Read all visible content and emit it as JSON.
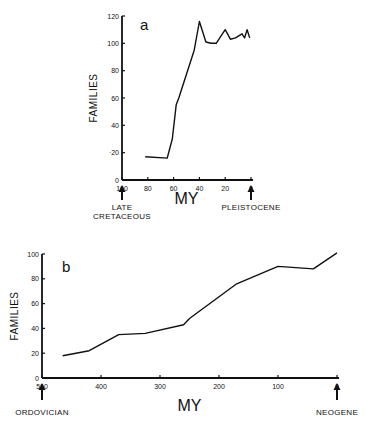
{
  "chart_data": [
    {
      "type": "line",
      "panel_label": "a",
      "title": "",
      "xlabel": "MY",
      "ylabel": "FAMILIES",
      "x_reversed": true,
      "xlim": [
        100,
        0
      ],
      "ylim": [
        0,
        120
      ],
      "x_ticks": [
        100,
        80,
        60,
        40,
        20,
        0
      ],
      "y_ticks": [
        0,
        20,
        40,
        60,
        80,
        100,
        120
      ],
      "y_tick_labels": [
        "0",
        "·20",
        "40",
        "60",
        "80",
        "100",
        "120"
      ],
      "grid": false,
      "annotations": [
        {
          "x": 100,
          "text": "LATE CRETACEOUS",
          "lines": [
            "LATE",
            "CRETACEOUS"
          ],
          "arrow": "up"
        },
        {
          "x": 0,
          "text": "PLEISTOCENE",
          "lines": [
            "PLEISTOCENE"
          ],
          "arrow": "up"
        }
      ],
      "series": [
        {
          "name": "families",
          "x": [
            82,
            65,
            61,
            58,
            56,
            44,
            40,
            35,
            31,
            27,
            20,
            16,
            12,
            7,
            5,
            3,
            1
          ],
          "y": [
            17,
            16,
            30,
            55,
            60,
            95,
            116,
            101,
            100,
            100,
            110,
            103,
            104,
            107,
            104,
            110,
            104
          ]
        }
      ]
    },
    {
      "type": "line",
      "panel_label": "b",
      "title": "",
      "xlabel": "MY",
      "ylabel": "FAMILIES",
      "x_reversed": true,
      "xlim": [
        500,
        0
      ],
      "ylim": [
        0,
        100
      ],
      "x_ticks": [
        500,
        400,
        300,
        200,
        100,
        0
      ],
      "y_ticks": [
        0,
        20,
        40,
        60,
        80,
        100
      ],
      "grid": false,
      "annotations": [
        {
          "x": 500,
          "text": "ORDOVICIAN",
          "lines": [
            "ORDOVICIAN"
          ],
          "arrow": "up"
        },
        {
          "x": 0,
          "text": "NEOGENE",
          "lines": [
            "NEOGENE"
          ],
          "arrow": "up"
        }
      ],
      "series": [
        {
          "name": "families",
          "x": [
            465,
            420,
            370,
            325,
            260,
            250,
            170,
            100,
            40,
            0
          ],
          "y": [
            18,
            22,
            35,
            36,
            43,
            48,
            76,
            90,
            88,
            101
          ]
        }
      ]
    }
  ]
}
